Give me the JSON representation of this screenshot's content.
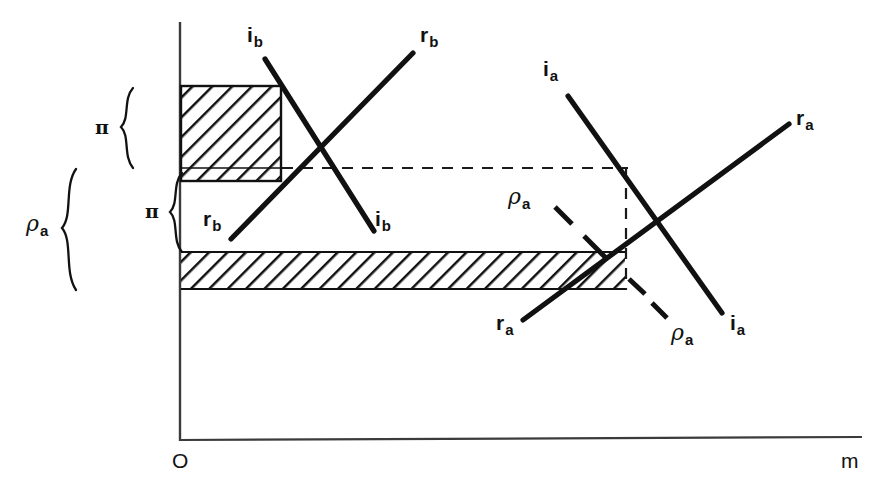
{
  "figure": {
    "background_color": "#ffffff",
    "ink_color": "#111111",
    "axes": {
      "origin_label": "O",
      "x_axis_label": "m",
      "y_axis_label": ""
    },
    "braces": [
      {
        "id": "pi-upper",
        "label": "π",
        "spans": "upper hatched block"
      },
      {
        "id": "pi-lower",
        "label": "π",
        "spans": "gap below dashed line"
      },
      {
        "id": "rho-a-outer",
        "label": "ρ",
        "sub": "a",
        "spans": "dashed line down to lower hatched band"
      }
    ],
    "curve_labels": [
      {
        "id": "ib-top",
        "base": "i",
        "sub": "b"
      },
      {
        "id": "rb-top",
        "base": "r",
        "sub": "b"
      },
      {
        "id": "rb-bottom",
        "base": "r",
        "sub": "b"
      },
      {
        "id": "ib-bottom",
        "base": "i",
        "sub": "b"
      },
      {
        "id": "ia-top",
        "base": "i",
        "sub": "a"
      },
      {
        "id": "ra-top",
        "base": "r",
        "sub": "a"
      },
      {
        "id": "ra-bottom",
        "base": "r",
        "sub": "a"
      },
      {
        "id": "ia-bottom",
        "base": "i",
        "sub": "a"
      },
      {
        "id": "rho-a-upper",
        "base": "ρ",
        "sub": "a"
      },
      {
        "id": "rho-a-lower",
        "base": "ρ",
        "sub": "a"
      }
    ],
    "regions": [
      {
        "id": "upper-hatch-block",
        "hatch": "diagonal-45",
        "description": "solid-outlined hatched rectangle at left, top"
      },
      {
        "id": "lower-hatch-band",
        "hatch": "diagonal-45",
        "description": "wide thin hatched band spanning most of the plot width"
      },
      {
        "id": "dashed-rect",
        "style": "dashed",
        "description": "dashed rectangle on the right half"
      }
    ]
  }
}
